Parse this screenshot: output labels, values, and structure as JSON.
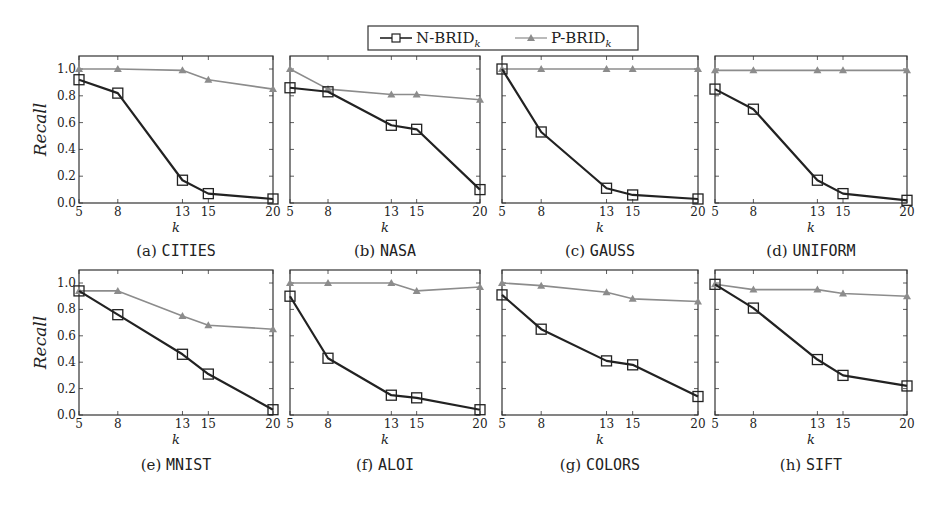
{
  "legend": {
    "entries": [
      {
        "name": "N-BRID",
        "subscript": "k",
        "marker": "square",
        "color": "#222222"
      },
      {
        "name": "P-BRID",
        "subscript": "k",
        "marker": "triangle",
        "color": "#8c8c8c"
      }
    ]
  },
  "colors": {
    "n_brid": "#222222",
    "p_brid": "#8c8c8c",
    "axis": "#333333"
  },
  "axes": {
    "xlabel": "k",
    "ylabel": "Recall",
    "xticks": [
      5,
      8,
      13,
      15,
      20
    ],
    "yticks": [
      "0.0",
      "0.2",
      "0.4",
      "0.6",
      "0.8",
      "1.0"
    ]
  },
  "chart_data": [
    {
      "type": "line",
      "panel": "(a)",
      "title": "CITIES",
      "x": [
        5,
        8,
        13,
        15,
        20
      ],
      "xlabel": "k",
      "ylabel": "Recall",
      "ylim": [
        0,
        1.08
      ],
      "series": [
        {
          "name": "N-BRID_k",
          "values": [
            0.92,
            0.82,
            0.17,
            0.07,
            0.03
          ]
        },
        {
          "name": "P-BRID_k",
          "values": [
            1.0,
            1.0,
            0.99,
            0.92,
            0.85
          ]
        }
      ]
    },
    {
      "type": "line",
      "panel": "(b)",
      "title": "NASA",
      "x": [
        5,
        8,
        13,
        15,
        20
      ],
      "xlabel": "k",
      "ylabel": "",
      "ylim": [
        0,
        1.08
      ],
      "series": [
        {
          "name": "N-BRID_k",
          "values": [
            0.86,
            0.83,
            0.58,
            0.55,
            0.1
          ]
        },
        {
          "name": "P-BRID_k",
          "values": [
            1.0,
            0.85,
            0.81,
            0.81,
            0.77
          ]
        }
      ]
    },
    {
      "type": "line",
      "panel": "(c)",
      "title": "GAUSS",
      "x": [
        5,
        8,
        13,
        15,
        20
      ],
      "xlabel": "k",
      "ylabel": "",
      "ylim": [
        0,
        1.08
      ],
      "series": [
        {
          "name": "N-BRID_k",
          "values": [
            1.0,
            0.53,
            0.11,
            0.06,
            0.03
          ]
        },
        {
          "name": "P-BRID_k",
          "values": [
            1.0,
            1.0,
            1.0,
            1.0,
            1.0
          ]
        }
      ]
    },
    {
      "type": "line",
      "panel": "(d)",
      "title": "UNIFORM",
      "x": [
        5,
        8,
        13,
        15,
        20
      ],
      "xlabel": "k",
      "ylabel": "",
      "ylim": [
        0,
        1.08
      ],
      "series": [
        {
          "name": "N-BRID_k",
          "values": [
            0.85,
            0.7,
            0.17,
            0.07,
            0.02
          ]
        },
        {
          "name": "P-BRID_k",
          "values": [
            0.99,
            0.99,
            0.99,
            0.99,
            0.99
          ]
        }
      ]
    },
    {
      "type": "line",
      "panel": "(e)",
      "title": "MNIST",
      "x": [
        5,
        8,
        13,
        15,
        20
      ],
      "xlabel": "k",
      "ylabel": "Recall",
      "ylim": [
        0,
        1.08
      ],
      "series": [
        {
          "name": "N-BRID_k",
          "values": [
            0.94,
            0.76,
            0.46,
            0.31,
            0.04
          ]
        },
        {
          "name": "P-BRID_k",
          "values": [
            0.94,
            0.94,
            0.75,
            0.68,
            0.65
          ]
        }
      ]
    },
    {
      "type": "line",
      "panel": "(f)",
      "title": "ALOI",
      "x": [
        5,
        8,
        13,
        15,
        20
      ],
      "xlabel": "k",
      "ylabel": "",
      "ylim": [
        0,
        1.08
      ],
      "series": [
        {
          "name": "N-BRID_k",
          "values": [
            0.9,
            0.43,
            0.15,
            0.13,
            0.04
          ]
        },
        {
          "name": "P-BRID_k",
          "values": [
            1.0,
            1.0,
            1.0,
            0.94,
            0.97
          ]
        }
      ]
    },
    {
      "type": "line",
      "panel": "(g)",
      "title": "COLORS",
      "x": [
        5,
        8,
        13,
        15,
        20
      ],
      "xlabel": "k",
      "ylabel": "",
      "ylim": [
        0,
        1.08
      ],
      "series": [
        {
          "name": "N-BRID_k",
          "values": [
            0.91,
            0.65,
            0.41,
            0.38,
            0.14
          ]
        },
        {
          "name": "P-BRID_k",
          "values": [
            1.0,
            0.98,
            0.93,
            0.88,
            0.86
          ]
        }
      ]
    },
    {
      "type": "line",
      "panel": "(h)",
      "title": "SIFT",
      "x": [
        5,
        8,
        13,
        15,
        20
      ],
      "xlabel": "k",
      "ylabel": "",
      "ylim": [
        0,
        1.08
      ],
      "series": [
        {
          "name": "N-BRID_k",
          "values": [
            0.99,
            0.81,
            0.42,
            0.3,
            0.22
          ]
        },
        {
          "name": "P-BRID_k",
          "values": [
            0.99,
            0.95,
            0.95,
            0.92,
            0.9
          ]
        }
      ]
    }
  ]
}
